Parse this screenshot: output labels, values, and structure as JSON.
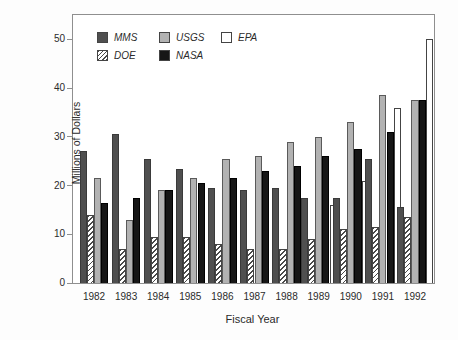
{
  "chart_data": {
    "type": "bar",
    "title": "",
    "xlabel": "Fiscal Year",
    "ylabel": "Millions of Dollars",
    "ylim": [
      0,
      55
    ],
    "y_ticks": [
      0,
      10,
      20,
      30,
      40,
      50
    ],
    "grid": false,
    "legend_position": "top-left-inside",
    "categories": [
      "1982",
      "1983",
      "1984",
      "1985",
      "1986",
      "1987",
      "1988",
      "1989",
      "1990",
      "1991",
      "1992"
    ],
    "series": [
      {
        "name": "MMS",
        "pattern": "solid",
        "color": "#4f4f4f",
        "style_key": "s-mms",
        "values": [
          27,
          30.5,
          25.5,
          23.5,
          19.5,
          19,
          19.5,
          17.5,
          17.5,
          25.5,
          15.5
        ]
      },
      {
        "name": "DOE",
        "pattern": "hatch-diagonal",
        "color": "#ffffff",
        "style_key": "s-doe",
        "values": [
          14,
          7,
          9.5,
          9.5,
          8,
          7,
          7,
          9,
          11,
          11.5,
          13.5
        ]
      },
      {
        "name": "USGS",
        "pattern": "solid",
        "color": "#b2b2b2",
        "style_key": "s-usgs",
        "values": [
          21.5,
          13,
          19,
          21.5,
          25.5,
          26,
          29,
          30,
          33,
          38.5,
          37.5
        ]
      },
      {
        "name": "NASA",
        "pattern": "solid",
        "color": "#161616",
        "style_key": "s-nasa",
        "values": [
          16.5,
          17.5,
          19,
          20.5,
          21.5,
          23,
          24,
          26,
          27.5,
          31,
          37.5
        ]
      },
      {
        "name": "EPA",
        "pattern": "solid",
        "color": "#ffffff",
        "style_key": "s-epa",
        "values": [
          null,
          null,
          null,
          null,
          null,
          null,
          null,
          16,
          21,
          36,
          50
        ]
      }
    ],
    "legend_rows": [
      [
        "MMS",
        "USGS",
        "EPA"
      ],
      [
        "DOE",
        "NASA"
      ]
    ]
  },
  "layout_colors": {
    "frame": "#8f8f8f",
    "text": "#2b2b2b",
    "background": "#fdfdfd"
  }
}
